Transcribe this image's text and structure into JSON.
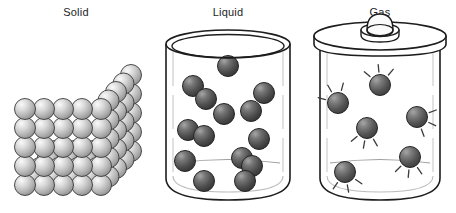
{
  "figure": {
    "background_color": "#ffffff",
    "outline_color": "#1d1d1d",
    "panel_count": 3
  },
  "panels": [
    {
      "id": "solid",
      "label": "Solid",
      "label_x": 76,
      "container": "none",
      "particle_arrangement": "close-packed cubic lattice",
      "particle_fill_light": "#f2f2f2",
      "particle_fill_dark": "#8e8e8e",
      "particle_radius": 10.5,
      "particle_count": 57,
      "motion_lines": false
    },
    {
      "id": "liquid",
      "label": "Liquid",
      "label_x": 76,
      "container": "open-beaker",
      "particle_arrangement": "loose random clusters",
      "particle_fill_light": "#8a8a8a",
      "particle_fill_dark": "#3a3a3a",
      "particle_radius": 10.5,
      "particle_count": 14,
      "motion_lines": false
    },
    {
      "id": "gas",
      "label": "Gas",
      "label_x": 76,
      "container": "sealed-jar-with-lid",
      "particle_arrangement": "widely spaced, free moving",
      "particle_fill_light": "#8a8a8a",
      "particle_fill_dark": "#4a4a4a",
      "particle_radius": 10.5,
      "particle_count": 6,
      "motion_lines": true
    }
  ],
  "chart_data": {
    "type": "diagram",
    "categories": [
      "Solid",
      "Liquid",
      "Gas"
    ],
    "series": [
      {
        "name": "particle_count",
        "values": [
          57,
          14,
          6
        ]
      }
    ],
    "solid_lattice": {
      "columns": 5,
      "rows": 5,
      "depth_offset_x": 7.5,
      "depth_offset_y": -8.5,
      "spacing_x": 19,
      "spacing_y": 19,
      "origin_x": 25,
      "origin_y": 185
    },
    "liquid_particles": [
      {
        "x": 76,
        "y": 66
      },
      {
        "x": 41,
        "y": 86
      },
      {
        "x": 54,
        "y": 99
      },
      {
        "x": 112,
        "y": 93
      },
      {
        "x": 72,
        "y": 114
      },
      {
        "x": 99,
        "y": 111
      },
      {
        "x": 36,
        "y": 130
      },
      {
        "x": 52,
        "y": 136
      },
      {
        "x": 107,
        "y": 139
      },
      {
        "x": 33,
        "y": 161
      },
      {
        "x": 90,
        "y": 158
      },
      {
        "x": 100,
        "y": 166
      },
      {
        "x": 52,
        "y": 181
      },
      {
        "x": 93,
        "y": 181
      }
    ],
    "gas_particles": [
      {
        "x": 76,
        "y": 85
      },
      {
        "x": 34,
        "y": 103
      },
      {
        "x": 113,
        "y": 117
      },
      {
        "x": 63,
        "y": 128
      },
      {
        "x": 106,
        "y": 157
      },
      {
        "x": 41,
        "y": 172
      }
    ],
    "xlabel": "",
    "ylabel": "",
    "legend": []
  }
}
